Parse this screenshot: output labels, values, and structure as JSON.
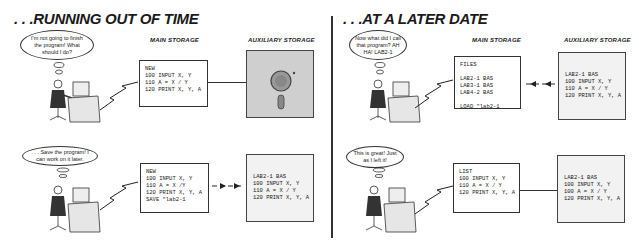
{
  "panels": [
    {
      "title": ". . .RUNNING OUT OF TIME",
      "main_label": "MAIN STORAGE",
      "aux_label": "AUXILIARY STORAGE",
      "scenes": [
        {
          "thought": "I'm not going to finish the program! What should I do?",
          "screen": "NEW\n100 INPUT X, Y\n110 A = X / Y\n120 PRINT X, Y, A",
          "disk": "",
          "connector": "line"
        },
        {
          "thought": ". . . Save the program! I can work on it later.",
          "screen": "NEW\n100 INPUT X, Y\n110 A = X /Y\n120 PRINT X, Y, A\nSAVE \"lab2-1",
          "disk": "LAB2-1 BAS\n100 INPUT X, Y\n110 A = X / Y\n120 PRINT X, Y, A",
          "connector": "arrow-right"
        }
      ]
    },
    {
      "title": ". . .AT A LATER DATE",
      "main_label": "MAIN STORAGE",
      "aux_label": "AUXILIARY STORAGE",
      "scenes": [
        {
          "thought": "Now what did I call that program? AH HA! LAB2-1",
          "screen": "FILES\n\nLAB2-1 BAS\nLAB3-1 BAS\nLAB4-2 BAS\n\nLOAD \"lab2-1",
          "disk": "LAB2-1 BAS\n100 INPUT X, Y\n110 A = X / Y\n120 PRINT X, Y, A",
          "connector": "arrow-left"
        },
        {
          "thought": "This is great! Just as I left it!",
          "screen": "LIST\n100 INPUT X, Y\n110 A = X / Y\n120 PRINT X, Y, A",
          "disk": "LAB2-1 BAS\n100 INPUT X, Y\n100 A = X / Y\n120 PRINT X, Y, A",
          "connector": "line"
        }
      ]
    }
  ]
}
